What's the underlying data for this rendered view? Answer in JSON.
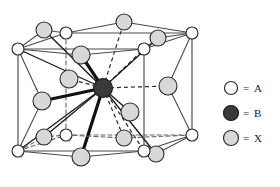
{
  "figure": {
    "colors": {
      "atom_a_fill": "#ffffff",
      "atom_b_fill": "#3a3a3a",
      "atom_x_fill": "#d8d8d8",
      "outline": "#2b2b2b",
      "cell_edge": "#4a4a4a",
      "bond_solid": "#1a1a1a",
      "bond_dashed": "#2b2b2b",
      "background": "#ffffff"
    }
  },
  "legend": {
    "equals": "=",
    "items": [
      {
        "key": "a",
        "marker": "open-circle",
        "symbol": "○",
        "label": "A",
        "fill": "#ffffff",
        "cx": 231,
        "cy": 88,
        "r": 6.5
      },
      {
        "key": "b",
        "marker": "filled-circle",
        "symbol": "●",
        "label": "B",
        "fill": "#3a3a3a",
        "cx": 231,
        "cy": 113,
        "r": 7.5
      },
      {
        "key": "x",
        "marker": "gray-circle",
        "symbol": "○",
        "label": "X",
        "fill": "#d8d8d8",
        "cx": 231,
        "cy": 138,
        "r": 7.5
      }
    ]
  },
  "cell": {
    "front_face": [
      {
        "name": "front-bottom-left",
        "x": 18,
        "y": 151
      },
      {
        "name": "front-bottom-right",
        "x": 144,
        "y": 151
      },
      {
        "name": "front-top-right",
        "x": 144,
        "y": 49
      },
      {
        "name": "front-top-left",
        "x": 18,
        "y": 49
      }
    ],
    "back_face": [
      {
        "name": "back-bottom-left",
        "x": 66,
        "y": 135
      },
      {
        "name": "back-bottom-right",
        "x": 192,
        "y": 135
      },
      {
        "name": "back-top-right",
        "x": 192,
        "y": 33
      },
      {
        "name": "back-top-left",
        "x": 66,
        "y": 33
      }
    ],
    "hidden_edges": [
      {
        "from": "back-bottom-left",
        "to": "back-bottom-right"
      },
      {
        "from": "back-bottom-left",
        "to": "back-top-left"
      },
      {
        "from": "back-bottom-left",
        "to": "front-bottom-left"
      }
    ]
  },
  "atoms": {
    "a": [
      {
        "name": "a-front-bottom-left",
        "x": 18,
        "y": 151,
        "r": 6.0
      },
      {
        "name": "a-front-bottom-right",
        "x": 144,
        "y": 151,
        "r": 6.0
      },
      {
        "name": "a-front-top-right",
        "x": 144,
        "y": 49,
        "r": 6.0
      },
      {
        "name": "a-front-top-left",
        "x": 18,
        "y": 49,
        "r": 6.0
      },
      {
        "name": "a-back-bottom-left",
        "x": 66,
        "y": 135,
        "r": 6.0
      },
      {
        "name": "a-back-bottom-right",
        "x": 192,
        "y": 135,
        "r": 6.0
      },
      {
        "name": "a-back-top-right",
        "x": 192,
        "y": 33,
        "r": 6.0
      },
      {
        "name": "a-back-top-left",
        "x": 66,
        "y": 33,
        "r": 6.0
      }
    ],
    "b": {
      "name": "b-body-centre",
      "x": 103,
      "y": 88,
      "r": 9.5
    },
    "x": [
      {
        "name": "x-top-face",
        "x": 81,
        "y": 55,
        "r": 9.0,
        "bond": "thick"
      },
      {
        "name": "x-bottom-face",
        "x": 81,
        "y": 157,
        "r": 9.0,
        "bond": "thick"
      },
      {
        "name": "x-left-face",
        "x": 42,
        "y": 101,
        "r": 9.0,
        "bond": "thick"
      },
      {
        "name": "x-right-face",
        "x": 168,
        "y": 86,
        "r": 9.0,
        "bond": "dashed"
      },
      {
        "name": "x-front-face",
        "x": 69,
        "y": 79,
        "r": 9.0,
        "bond": "dashed"
      },
      {
        "name": "x-back-face",
        "x": 130,
        "y": 112,
        "r": 9.0,
        "bond": "solid"
      }
    ],
    "x_outer": [
      {
        "name": "x-outer-top-left",
        "x": 44,
        "y": 30,
        "r": 8.0
      },
      {
        "name": "x-outer-top-centre",
        "x": 124,
        "y": 22,
        "r": 8.0
      },
      {
        "name": "x-outer-top-right",
        "x": 158,
        "y": 38,
        "r": 8.0
      },
      {
        "name": "x-outer-bottom-left",
        "x": 44,
        "y": 137,
        "r": 8.0
      },
      {
        "name": "x-outer-bottom-mid",
        "x": 124,
        "y": 138,
        "r": 8.0
      },
      {
        "name": "x-outer-bottom-right",
        "x": 156,
        "y": 154,
        "r": 8.0
      }
    ]
  },
  "bonds": {
    "thick_width": 3.2,
    "solid_width": 1.3,
    "dashed_width": 1.2,
    "dash_pattern": "4,3"
  }
}
